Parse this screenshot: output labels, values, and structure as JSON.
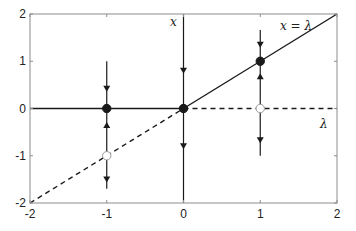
{
  "chart_data": {
    "type": "line",
    "title": "",
    "subtitle": "Bifurcation diagram (transcritical): equilibria x vs parameter lambda with flow arrows",
    "xlabel": "λ",
    "ylabel": "x",
    "xlim": [
      -2,
      2
    ],
    "ylim": [
      -2,
      2
    ],
    "xticks": [
      -2,
      -1,
      0,
      1,
      2
    ],
    "yticks": [
      -2,
      -1,
      0,
      1,
      2
    ],
    "xtick_labels": [
      "-2",
      "-1",
      "0",
      "1",
      "2"
    ],
    "ytick_labels": [
      "-2",
      "-1",
      "0",
      "1",
      "2"
    ],
    "grid": false,
    "legend": null,
    "annotations": [
      {
        "text": "x",
        "at": [
          -0.15,
          1.85
        ],
        "role": "vertical axis label"
      },
      {
        "text": "x = λ",
        "at": [
          1.55,
          1.8
        ],
        "role": "diagonal branch label"
      },
      {
        "text": "λ",
        "at": [
          1.9,
          -0.28
        ],
        "role": "horizontal axis label"
      }
    ],
    "series": [
      {
        "name": "x=0 stable (λ<0)",
        "style": "solid",
        "x": [
          -2,
          0
        ],
        "y": [
          0,
          0
        ]
      },
      {
        "name": "x=0 unstable (λ>0)",
        "style": "dashed",
        "x": [
          0,
          2
        ],
        "y": [
          0,
          0
        ]
      },
      {
        "name": "x=λ unstable (λ<0)",
        "style": "dashed",
        "x": [
          -2,
          0
        ],
        "y": [
          -2,
          0
        ]
      },
      {
        "name": "x=λ stable (λ>0)",
        "style": "solid",
        "x": [
          0,
          2
        ],
        "y": [
          0,
          2
        ]
      }
    ],
    "flow_lines": [
      {
        "lambda": -1,
        "y_range": [
          1.0,
          -1.7
        ],
        "arrows": [
          {
            "y": 0.42,
            "dir": "down"
          },
          {
            "y": -0.35,
            "dir": "up"
          },
          {
            "y": -1.5,
            "dir": "down"
          }
        ]
      },
      {
        "lambda": 0,
        "y_range": [
          2.0,
          -2.0
        ],
        "arrows": [
          {
            "y": 0.8,
            "dir": "down"
          },
          {
            "y": -0.8,
            "dir": "down"
          }
        ]
      },
      {
        "lambda": 1,
        "y_range": [
          1.66,
          -1.0
        ],
        "arrows": [
          {
            "y": 1.35,
            "dir": "down"
          },
          {
            "y": 0.68,
            "dir": "up"
          },
          {
            "y": -0.67,
            "dir": "down"
          }
        ]
      }
    ],
    "points": [
      {
        "x": -1,
        "y": 0,
        "filled": true,
        "label": "stable"
      },
      {
        "x": -1,
        "y": -1,
        "filled": false,
        "label": "unstable"
      },
      {
        "x": 0,
        "y": 0,
        "filled": true,
        "label": "bifurcation point"
      },
      {
        "x": 1,
        "y": 1,
        "filled": true,
        "label": "stable"
      },
      {
        "x": 1,
        "y": 0,
        "filled": false,
        "label": "unstable"
      }
    ],
    "colors": {
      "line": "#1a1a1a",
      "axes": "#8c8c8c",
      "open_fill": "#ffffff"
    }
  }
}
